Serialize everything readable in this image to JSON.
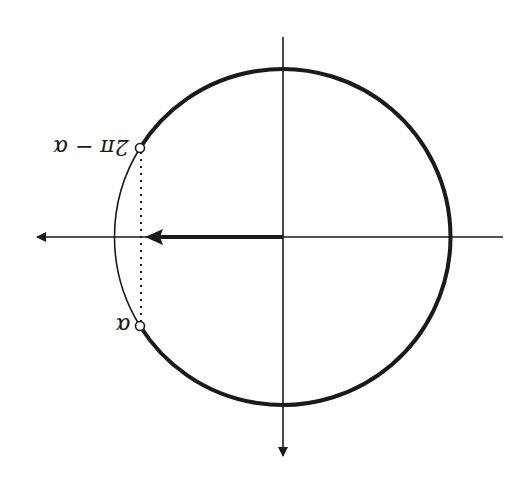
{
  "figure": {
    "orientation": "rotated-180",
    "labels": {
      "alpha": "α",
      "two_pi_minus_alpha": "2π − α"
    },
    "colors": {
      "stroke": "#1a1a1a",
      "background": "#ffffff"
    }
  }
}
